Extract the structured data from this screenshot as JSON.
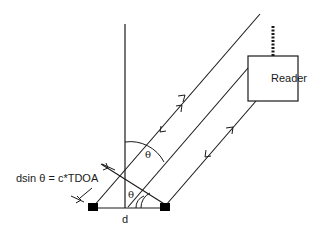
{
  "diagram": {
    "reader_label": "Reader",
    "equation_label": "dsin θ = c*TDOA",
    "baseline_label": "d",
    "angle_label_top": "θ",
    "angle_label_bottom": "θ",
    "colors": {
      "line": "#1a1a1a",
      "antenna": "#000000",
      "background": "#ffffff"
    }
  }
}
